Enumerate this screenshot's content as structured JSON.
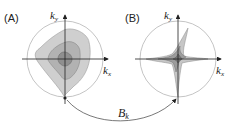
{
  "panels": [
    {
      "label": "(A)",
      "x_axis": "k",
      "x_sub": "x",
      "y_axis": "k",
      "y_sub": "y",
      "shape": "nested-rounded-diamond-contours"
    },
    {
      "label": "(B)",
      "x_axis": "k",
      "x_sub": "x",
      "y_axis": "k",
      "y_sub": "y",
      "shape": "star-shaped-contours"
    }
  ],
  "connector": {
    "label": "B",
    "sub": "k"
  },
  "colors": {
    "outer_fill": "#c8c8c8",
    "mid_fill": "#a9a9a9",
    "inner_fill": "#8a8a8a",
    "circle": "#b0b0b0",
    "axis": "#222222"
  }
}
